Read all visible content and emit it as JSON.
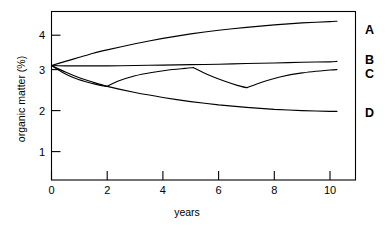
{
  "chart_data": {
    "type": "line",
    "title": "",
    "subtitle": "",
    "xlabel": "years",
    "ylabel": "organic matter (%)",
    "xlim": [
      -0.45,
      11.05
    ],
    "ylim": [
      0.3,
      4.62
    ],
    "xticks": [
      0,
      2,
      4,
      6,
      8,
      10
    ],
    "xticklabels": [
      "0",
      "2",
      "4",
      "6",
      "8",
      "10"
    ],
    "yticks": [
      1,
      2,
      3,
      4
    ],
    "yticklabels": [
      "1",
      "2",
      "3",
      "4"
    ],
    "grid": false,
    "legend_position": "right-of-axes-inline",
    "frame": "box",
    "start_value": 3.1,
    "series": [
      {
        "name": "A",
        "label": "A",
        "label_value": "A",
        "x": [
          0,
          0.5,
          1,
          1.5,
          2,
          3,
          4,
          5,
          6,
          7,
          8,
          9,
          10,
          10.25
        ],
        "values": [
          3.1,
          3.2,
          3.3,
          3.4,
          3.48,
          3.63,
          3.76,
          3.87,
          3.96,
          4.03,
          4.09,
          4.14,
          4.17,
          4.18
        ]
      },
      {
        "name": "B",
        "label": "B",
        "label_value": "B",
        "x": [
          0,
          0.5,
          1,
          2,
          3,
          4,
          5,
          6,
          7,
          8,
          9,
          10,
          10.25
        ],
        "values": [
          3.1,
          3.09,
          3.09,
          3.09,
          3.1,
          3.11,
          3.12,
          3.13,
          3.15,
          3.16,
          3.18,
          3.19,
          3.2
        ]
      },
      {
        "name": "C",
        "label": "C",
        "label_value": "C",
        "x": [
          0,
          0.4,
          0.8,
          1.2,
          1.6,
          2,
          2.02,
          2.4,
          3,
          3.6,
          4.2,
          4.8,
          5.1,
          5.12,
          5.6,
          6.2,
          6.7,
          7,
          7.02,
          7.5,
          8.2,
          9,
          10,
          10.25
        ],
        "values": [
          3.1,
          2.93,
          2.8,
          2.71,
          2.64,
          2.59,
          2.6,
          2.72,
          2.85,
          2.93,
          2.99,
          3.03,
          3.05,
          3.04,
          2.88,
          2.72,
          2.61,
          2.56,
          2.56,
          2.68,
          2.82,
          2.92,
          2.99,
          3.0
        ],
        "note": "two sawtooth depletion-recovery cycles with resets at year 2 and year 5, minima at year 2 (2.59) and year 7 (2.56)"
      },
      {
        "name": "D",
        "label": "D",
        "label_value": "D",
        "x": [
          0,
          0.5,
          1,
          1.5,
          2,
          3,
          4,
          5,
          6,
          7,
          8,
          9,
          10,
          10.25
        ],
        "values": [
          3.1,
          2.94,
          2.8,
          2.69,
          2.59,
          2.44,
          2.32,
          2.22,
          2.14,
          2.08,
          2.03,
          2.0,
          1.98,
          1.98
        ]
      }
    ]
  }
}
